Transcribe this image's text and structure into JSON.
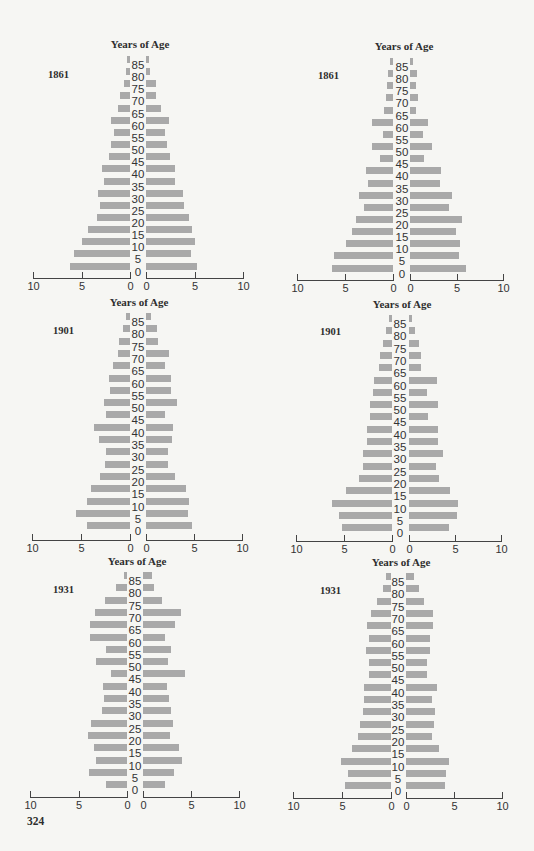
{
  "page": {
    "page_number": "324"
  },
  "common": {
    "title": "Years of Age",
    "age_groups": [
      "85",
      "80",
      "75",
      "70",
      "65",
      "60",
      "55",
      "50",
      "45",
      "40",
      "35",
      "30",
      "25",
      "20",
      "15",
      "10",
      "5",
      "0"
    ],
    "axis_tick_labels": [
      "10",
      "5",
      "0"
    ],
    "bar_color": "#a9a9a9",
    "text_color": "#2e2e2e",
    "background_color": "#f6f6f3"
  },
  "chart_data": [
    {
      "type": "bar",
      "orientation": "horizontal-population-pyramid",
      "position": "top-left",
      "title": "Years of Age",
      "label": "1861",
      "categories": [
        "85",
        "80",
        "75",
        "70",
        "65",
        "60",
        "55",
        "50",
        "45",
        "40",
        "35",
        "30",
        "25",
        "20",
        "15",
        "10",
        "5",
        "0"
      ],
      "series": [
        {
          "name": "left",
          "values": [
            0.3,
            0.4,
            0.6,
            1.0,
            1.2,
            2.0,
            1.6,
            2.0,
            2.2,
            2.9,
            2.7,
            3.3,
            3.1,
            3.4,
            4.3,
            5.0,
            5.8,
            6.2
          ]
        },
        {
          "name": "right",
          "values": [
            0.3,
            0.4,
            1.0,
            1.0,
            1.5,
            2.4,
            2.0,
            2.2,
            2.5,
            3.0,
            3.0,
            3.8,
            3.9,
            4.4,
            4.7,
            5.0,
            4.6,
            5.3
          ]
        }
      ],
      "xlabel": "",
      "ylabel": "Years of Age",
      "xlim_left": [
        10,
        0
      ],
      "xlim_right": [
        0,
        10
      ],
      "x_ticks": [
        10,
        5,
        0,
        0,
        5,
        10
      ],
      "grid": false
    },
    {
      "type": "bar",
      "orientation": "horizontal-population-pyramid",
      "position": "top-right",
      "title": "Years of Age",
      "label": "1861",
      "categories": [
        "85",
        "80",
        "75",
        "70",
        "65",
        "60",
        "55",
        "50",
        "45",
        "40",
        "35",
        "30",
        "25",
        "20",
        "15",
        "10",
        "5",
        "0"
      ],
      "series": [
        {
          "name": "left",
          "values": [
            0.3,
            0.5,
            0.6,
            0.7,
            0.9,
            2.2,
            1.0,
            2.2,
            1.4,
            2.8,
            2.6,
            3.5,
            3.0,
            3.9,
            4.3,
            4.9,
            6.1,
            6.4
          ]
        },
        {
          "name": "right",
          "values": [
            0.3,
            0.8,
            0.6,
            0.9,
            0.6,
            1.9,
            1.4,
            2.4,
            1.5,
            3.3,
            3.2,
            4.5,
            4.2,
            5.6,
            4.9,
            5.4,
            5.3,
            6.0
          ]
        }
      ],
      "xlabel": "",
      "ylabel": "Years of Age",
      "xlim_left": [
        10,
        0
      ],
      "xlim_right": [
        0,
        10
      ],
      "x_ticks": [
        10,
        5,
        0,
        0,
        5,
        10
      ],
      "grid": false
    },
    {
      "type": "bar",
      "orientation": "horizontal-population-pyramid",
      "position": "middle-left",
      "title": "Years of Age",
      "label": "1901",
      "categories": [
        "85",
        "80",
        "75",
        "70",
        "65",
        "60",
        "55",
        "50",
        "45",
        "40",
        "35",
        "30",
        "25",
        "20",
        "15",
        "10",
        "5",
        "0"
      ],
      "series": [
        {
          "name": "left",
          "values": [
            0.4,
            0.7,
            1.1,
            1.2,
            1.7,
            2.1,
            2.0,
            2.7,
            2.5,
            3.7,
            3.2,
            2.4,
            2.6,
            3.1,
            4.0,
            4.4,
            5.5,
            4.4
          ]
        },
        {
          "name": "right",
          "values": [
            0.5,
            1.1,
            1.2,
            2.4,
            2.0,
            2.6,
            2.6,
            3.2,
            2.0,
            2.8,
            2.7,
            2.3,
            2.3,
            3.0,
            4.2,
            4.5,
            4.4,
            4.8
          ]
        }
      ],
      "xlabel": "",
      "ylabel": "Years of Age",
      "xlim_left": [
        10,
        0
      ],
      "xlim_right": [
        0,
        10
      ],
      "x_ticks": [
        10,
        5,
        0,
        0,
        5,
        10
      ],
      "grid": false
    },
    {
      "type": "bar",
      "orientation": "horizontal-population-pyramid",
      "position": "middle-right",
      "title": "Years of Age",
      "label": "1901",
      "categories": [
        "85",
        "80",
        "75",
        "70",
        "65",
        "60",
        "55",
        "50",
        "45",
        "40",
        "35",
        "30",
        "25",
        "20",
        "15",
        "10",
        "5",
        "0"
      ],
      "series": [
        {
          "name": "left",
          "values": [
            0.35,
            0.6,
            0.9,
            1.2,
            1.4,
            1.9,
            2.0,
            2.3,
            2.3,
            2.6,
            2.6,
            3.0,
            3.0,
            3.4,
            4.8,
            6.3,
            5.5,
            5.2
          ]
        },
        {
          "name": "right",
          "values": [
            0.3,
            0.65,
            1.1,
            1.35,
            1.25,
            3.0,
            2.0,
            3.1,
            2.1,
            3.1,
            3.2,
            3.7,
            2.9,
            3.3,
            4.5,
            5.3,
            5.2,
            4.4
          ]
        }
      ],
      "xlabel": "",
      "ylabel": "Years of Age",
      "xlim_left": [
        10,
        0
      ],
      "xlim_right": [
        0,
        10
      ],
      "x_ticks": [
        10,
        5,
        0,
        0,
        5,
        10
      ],
      "grid": false
    },
    {
      "type": "bar",
      "orientation": "horizontal-population-pyramid",
      "position": "bottom-left",
      "title": "Years of Age",
      "label": "1931",
      "categories": [
        "85",
        "80",
        "75",
        "70",
        "65",
        "60",
        "55",
        "50",
        "45",
        "40",
        "35",
        "30",
        "25",
        "20",
        "15",
        "10",
        "5",
        "0"
      ],
      "series": [
        {
          "name": "left",
          "values": [
            0.35,
            1.1,
            2.3,
            3.3,
            3.8,
            3.8,
            2.2,
            3.2,
            1.7,
            2.5,
            2.4,
            2.6,
            3.7,
            4.0,
            3.4,
            3.2,
            3.9,
            2.2
          ]
        },
        {
          "name": "right",
          "values": [
            0.9,
            1.1,
            2.0,
            4.0,
            3.3,
            2.3,
            2.9,
            2.6,
            4.4,
            2.5,
            2.7,
            2.9,
            3.1,
            2.8,
            3.7,
            4.1,
            3.2,
            2.3
          ]
        }
      ],
      "xlabel": "",
      "ylabel": "Years of Age",
      "xlim_left": [
        10,
        0
      ],
      "xlim_right": [
        0,
        10
      ],
      "x_ticks": [
        10,
        5,
        0,
        0,
        5,
        10
      ],
      "grid": false
    },
    {
      "type": "bar",
      "orientation": "horizontal-population-pyramid",
      "position": "bottom-right",
      "title": "Years of Age",
      "label": "1931",
      "categories": [
        "85",
        "80",
        "75",
        "70",
        "65",
        "60",
        "55",
        "50",
        "45",
        "40",
        "35",
        "30",
        "25",
        "20",
        "15",
        "10",
        "5",
        "0"
      ],
      "series": [
        {
          "name": "left",
          "values": [
            0.5,
            0.85,
            1.4,
            2.0,
            2.4,
            2.2,
            2.6,
            2.2,
            2.2,
            2.8,
            2.8,
            2.9,
            3.2,
            3.4,
            4.0,
            5.1,
            4.35,
            4.65
          ]
        },
        {
          "name": "right",
          "values": [
            0.8,
            1.4,
            1.85,
            2.8,
            2.8,
            2.5,
            2.5,
            2.2,
            2.2,
            3.2,
            2.7,
            3.0,
            2.9,
            2.7,
            3.4,
            4.5,
            4.2,
            4.1
          ]
        }
      ],
      "xlabel": "",
      "ylabel": "Years of Age",
      "xlim_left": [
        10,
        0
      ],
      "xlim_right": [
        0,
        10
      ],
      "x_ticks": [
        10,
        5,
        0,
        0,
        5,
        10
      ],
      "grid": false
    }
  ]
}
